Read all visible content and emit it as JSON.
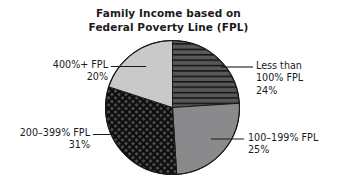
{
  "chart_data": {
    "type": "pie",
    "title": "Family Income based on Federal Poverty Line (FPL)",
    "title_lines": [
      "Family Income based on",
      "Federal Poverty Line (FPL)"
    ],
    "xlabel": "",
    "ylabel": "",
    "legend_position": "callout-labels",
    "grid": false,
    "total": 100,
    "unit": "%",
    "start_angle_deg": 0,
    "direction": "clockwise",
    "categories": [
      "Less than 100% FPL",
      "100–199% FPL",
      "200–399% FPL",
      "400%+ FPL"
    ],
    "values": [
      24,
      25,
      31,
      20
    ],
    "slices": [
      {
        "id": "less-than-100",
        "label_lines": [
          "Less than",
          "100% FPL",
          "24%"
        ],
        "category": "Less than 100% FPL",
        "value": 24,
        "value_text": "24%",
        "fill": "#58585a",
        "pattern": "horizontal-lines",
        "pattern_color": "#111111",
        "start_deg": 0,
        "end_deg": 86.4
      },
      {
        "id": "100-199",
        "label_lines": [
          "100–199% FPL",
          "25%"
        ],
        "category": "100–199% FPL",
        "value": 25,
        "value_text": "25%",
        "fill": "#8a8a8c",
        "pattern": "solid",
        "pattern_color": "",
        "start_deg": 86.4,
        "end_deg": 176.4
      },
      {
        "id": "200-399",
        "label_lines": [
          "200–399% FPL",
          "31%"
        ],
        "category": "200–399% FPL",
        "value": 31,
        "value_text": "31%",
        "fill": "#4a4a4c",
        "pattern": "crosshatch-diagonal",
        "pattern_color": "#0d0d0d",
        "start_deg": 176.4,
        "end_deg": 288.0
      },
      {
        "id": "400-plus",
        "label_lines": [
          "400%+ FPL",
          "20%"
        ],
        "category": "400%+ FPL",
        "value": 20,
        "value_text": "20%",
        "fill": "#c9c9c9",
        "pattern": "solid",
        "pattern_color": "",
        "start_deg": 288.0,
        "end_deg": 360.0
      }
    ]
  },
  "title": {
    "line1": "Family Income based on",
    "line2": "Federal Poverty Line (FPL)"
  },
  "labels": {
    "four_hundred_plus": {
      "line1": "400%+ FPL",
      "line2": "20%"
    },
    "two_hundred_to_399": {
      "line1": "200–399% FPL",
      "line2": "31%"
    },
    "less_than_100": {
      "line1": "Less than",
      "line2": "100% FPL",
      "line3": "24%"
    },
    "one_hundred_to_199": {
      "line1": "100–199% FPL",
      "line2": "25%"
    }
  },
  "colors": {
    "background": "#ffffff",
    "text": "#1a1a1a",
    "slice_light_gray": "#c9c9c9",
    "slice_medium_gray": "#8a8a8c",
    "slice_dark_hatch": "#58585a",
    "slice_dark_crosshatch": "#4a4a4c",
    "outline": "#1a1a1a",
    "leader_line": "#1a1a1a"
  }
}
